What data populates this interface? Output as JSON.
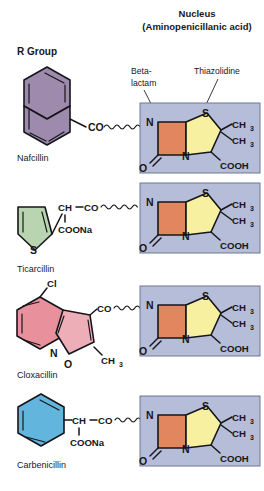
{
  "figure": {
    "title_line1": "Nucleus",
    "title_line2": "(Aminopenicillanic acid)",
    "r_group_header": "R Group"
  },
  "callouts": {
    "beta_lactam_line1": "Beta-",
    "beta_lactam_line2": "lactam",
    "thiazolidine": "Thiazolidine"
  },
  "colors": {
    "nucleus_background": "#b6bdd8",
    "nucleus_border": "#6f7694",
    "beta_lactam_ring": "#e2865f",
    "thiazolidine_ring": "#f6f0a0",
    "naphthalene": "#9d8aad",
    "thiophene": "#b9d4b1",
    "benzene_cloxacillin": "#e8909c",
    "isoxazole_cloxacillin": "#edaeb8",
    "benzene_carbenicillin": "#62b6dd",
    "bond": "#16161b",
    "text": "#17171c"
  },
  "nucleus": {
    "atoms": {
      "amide_n": "N",
      "carbonyl_o": "O",
      "sulfur": "S",
      "ring_n": "N",
      "methyl_1": "CH",
      "methyl_1_sub": "3",
      "methyl_2": "CH",
      "methyl_2_sub": "3",
      "carboxyl": "COOH"
    }
  },
  "rows": [
    {
      "name": "Nafcillin",
      "r_group_type": "naphthalene",
      "linker": "CO",
      "substituents": []
    },
    {
      "name": "Ticarcillin",
      "r_group_type": "thiophene",
      "linker": "CO",
      "substituents": [
        "CH",
        "COONa",
        "S"
      ]
    },
    {
      "name": "Cloxacillin",
      "r_group_type": "chlorophenyl-isoxazole",
      "linker": "CO",
      "substituents": [
        "Cl",
        "N",
        "O",
        "CH",
        "3"
      ]
    },
    {
      "name": "Carbenicillin",
      "r_group_type": "phenyl",
      "linker": "CO",
      "substituents": [
        "CH",
        "COONa"
      ]
    }
  ],
  "labels": {
    "cl": "Cl",
    "s": "S",
    "n": "N",
    "o": "O",
    "ch": "CH",
    "co": "CO",
    "coona": "COONa",
    "ch3_base": "CH",
    "ch3_sub": "3"
  }
}
